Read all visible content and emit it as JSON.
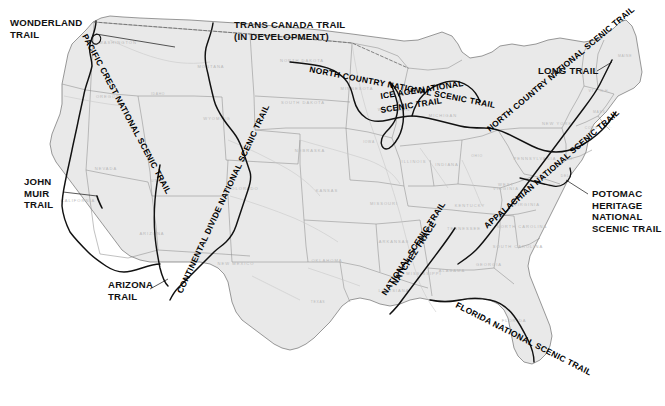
{
  "map": {
    "title": "National Scenic Trails of the United States",
    "background_color": "#ffffff",
    "land_fill": "#e9e9e9",
    "land_fill_alt": "#e3e3e3",
    "state_border_color": "#8d8d8d",
    "coast_color": "#6e6e6e",
    "trail_color": "#111111",
    "state_label_color": "#b9b9b9",
    "label_color": "#111111"
  },
  "callouts": [
    {
      "id": "wonderland",
      "lines": [
        "WONDERLAND",
        "TRAIL"
      ],
      "x": 10,
      "y": 26,
      "leader": [
        [
          96,
          34
        ],
        [
          175,
          47
        ]
      ]
    },
    {
      "id": "trans-canada",
      "lines": [
        "TRANS CANADA TRAIL",
        "(IN DEVELOPMENT)"
      ],
      "x": 234,
      "y": 28,
      "leader": null
    },
    {
      "id": "long-trail",
      "lines": [
        "LONG TRAIL"
      ],
      "x": 538,
      "y": 74,
      "leader": [
        [
          597,
          71
        ],
        [
          612,
          62
        ]
      ]
    },
    {
      "id": "john-muir",
      "lines": [
        "JOHN",
        "MUIR",
        "TRAIL"
      ],
      "x": 24,
      "y": 185,
      "leader": [
        [
          63,
          192
        ],
        [
          97,
          196
        ]
      ]
    },
    {
      "id": "potomac",
      "lines": [
        "POTOMAC",
        "HERITAGE",
        "NATIONAL",
        "SCENIC TRAIL"
      ],
      "x": 592,
      "y": 197,
      "leader": [
        [
          588,
          194
        ],
        [
          566,
          180
        ]
      ]
    },
    {
      "id": "arizona",
      "lines": [
        "ARIZONA",
        "TRAIL"
      ],
      "x": 108,
      "y": 288,
      "leader": [
        [
          150,
          289
        ],
        [
          168,
          279
        ]
      ]
    }
  ],
  "trail_labels": [
    {
      "id": "pacific-crest",
      "text": "PACIFIC CREST NATIONAL SCENIC TRAIL",
      "x": 82,
      "y": 36,
      "rotate": 62,
      "size": 8.4
    },
    {
      "id": "north-country",
      "text": "NORTH COUNTRY NATIONAL SCENIC TRAIL",
      "x": 309,
      "y": 72,
      "rotate": 11,
      "size": 8.4
    },
    {
      "id": "ice-age",
      "text": "ICE AGE NATIONAL",
      "x": 381,
      "y": 99,
      "rotate": -9,
      "size": 8.4
    },
    {
      "id": "ice-age-2",
      "text": "SCENIC TRAIL",
      "x": 381,
      "y": 113,
      "rotate": -9,
      "size": 8.4
    },
    {
      "id": "north-country-east",
      "text": "NORTH COUNTRY NATIONAL SCENIC TRAIL",
      "x": 490,
      "y": 132,
      "rotate": -40,
      "size": 7.8
    },
    {
      "id": "appalachian",
      "text": "APPALACHIAN NATIONAL SCENIC TRAIL",
      "x": 487,
      "y": 229,
      "rotate": -41,
      "size": 7.8
    },
    {
      "id": "continental-divide",
      "text": "CONTINENTAL DIVIDE NATIONAL SCENIC TRAIL",
      "x": 182,
      "y": 294,
      "rotate": -65,
      "size": 7.8
    },
    {
      "id": "natchez-trace",
      "text": "NATCHEZ TRACE",
      "x": 396,
      "y": 286,
      "rotate": -57,
      "size": 7.8
    },
    {
      "id": "natchez-trace-2",
      "text": "NATIONAL SCENIC TRAIL",
      "x": 386,
      "y": 296,
      "rotate": -57,
      "size": 7.8
    },
    {
      "id": "florida",
      "text": "FLORIDA NATIONAL SCENIC TRAIL",
      "x": 455,
      "y": 307,
      "rotate": 27,
      "size": 8.4
    }
  ],
  "states": [
    {
      "name": "WASHINGTON",
      "x": 118,
      "y": 44
    },
    {
      "name": "OREGON",
      "x": 108,
      "y": 98
    },
    {
      "name": "IDAHO",
      "x": 158,
      "y": 95
    },
    {
      "name": "MONTANA",
      "x": 211,
      "y": 68
    },
    {
      "name": "NORTH  DAKOTA",
      "x": 302,
      "y": 62
    },
    {
      "name": "SOUTH  DAKOTA",
      "x": 303,
      "y": 104
    },
    {
      "name": "MINNESOTA",
      "x": 357,
      "y": 90
    },
    {
      "name": "WISCONSIN",
      "x": 394,
      "y": 111
    },
    {
      "name": "MICHIGAN",
      "x": 443,
      "y": 117
    },
    {
      "name": "IOWA",
      "x": 369,
      "y": 143
    },
    {
      "name": "NEBRASKA",
      "x": 310,
      "y": 152
    },
    {
      "name": "WYOMING",
      "x": 217,
      "y": 120
    },
    {
      "name": "NEVADA",
      "x": 106,
      "y": 170
    },
    {
      "name": "UTAH",
      "x": 157,
      "y": 182
    },
    {
      "name": "COLORADO",
      "x": 243,
      "y": 190
    },
    {
      "name": "KANSAS",
      "x": 327,
      "y": 192
    },
    {
      "name": "MISSOURI",
      "x": 384,
      "y": 205
    },
    {
      "name": "ILLINOIS",
      "x": 414,
      "y": 163
    },
    {
      "name": "INDIANA",
      "x": 447,
      "y": 166
    },
    {
      "name": "OHIO",
      "x": 477,
      "y": 157
    },
    {
      "name": "KENTUCKY",
      "x": 470,
      "y": 207
    },
    {
      "name": "TENNESSEE",
      "x": 464,
      "y": 230
    },
    {
      "name": "CALIFORNIA",
      "x": 78,
      "y": 202
    },
    {
      "name": "ARIZONA",
      "x": 152,
      "y": 235
    },
    {
      "name": "NEW  MEXICO",
      "x": 236,
      "y": 265
    },
    {
      "name": "OKLAHOMA",
      "x": 327,
      "y": 262
    },
    {
      "name": "TEXAS",
      "x": 318,
      "y": 303
    },
    {
      "name": "ARKANSAS",
      "x": 394,
      "y": 243
    },
    {
      "name": "LOUISIANA",
      "x": 394,
      "y": 292
    },
    {
      "name": "MISSISSIPPI",
      "x": 424,
      "y": 275
    },
    {
      "name": "ALABAMA",
      "x": 452,
      "y": 272
    },
    {
      "name": "GEORGIA",
      "x": 489,
      "y": 266
    },
    {
      "name": "FLORIDA",
      "x": 514,
      "y": 322
    },
    {
      "name": "SOUTH  CAROLINA",
      "x": 518,
      "y": 248
    },
    {
      "name": "NORTH  CAROLINA",
      "x": 522,
      "y": 228
    },
    {
      "name": "VIRGINIA",
      "x": 527,
      "y": 206
    },
    {
      "name": "WEST\nVIRGINIA",
      "x": 506,
      "y": 186
    },
    {
      "name": "PENNSYLVANIA",
      "x": 535,
      "y": 160
    },
    {
      "name": "NEW  YORK",
      "x": 557,
      "y": 125
    },
    {
      "name": "MAINE",
      "x": 625,
      "y": 57
    },
    {
      "name": "MD",
      "x": 552,
      "y": 187
    },
    {
      "name": "N.J.",
      "x": 570,
      "y": 160
    },
    {
      "name": "DEL.",
      "x": 566,
      "y": 177
    },
    {
      "name": "VT.",
      "x": 592,
      "y": 92
    },
    {
      "name": "N.H.",
      "x": 605,
      "y": 92
    },
    {
      "name": "MASS.",
      "x": 600,
      "y": 113
    },
    {
      "name": "CONN.",
      "x": 592,
      "y": 129
    },
    {
      "name": "R.I.",
      "x": 608,
      "y": 128
    }
  ]
}
